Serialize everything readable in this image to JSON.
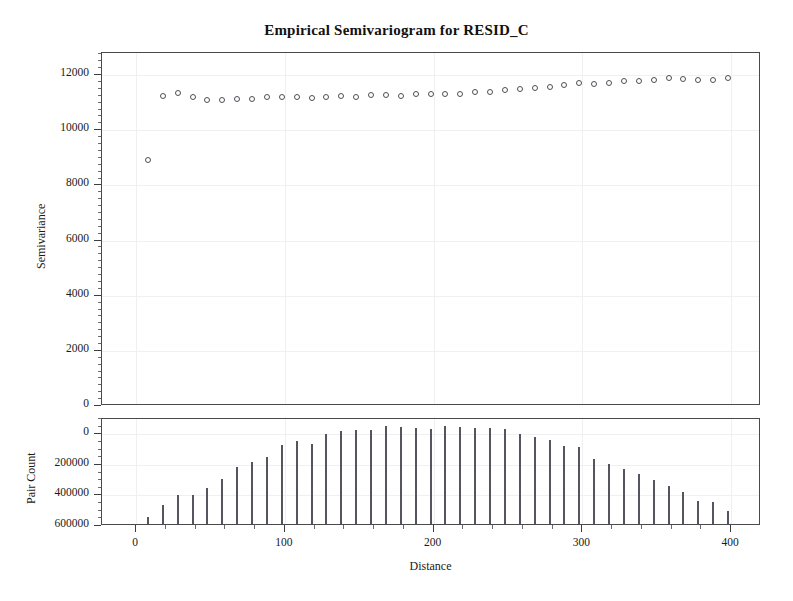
{
  "chart_data": [
    {
      "id": "semivariogram",
      "type": "scatter",
      "title": "Empirical Semivariogram for RESID_C",
      "xlabel": "Distance",
      "ylabel": "Semivariance",
      "xlim": [
        0,
        410
      ],
      "ylim": [
        0,
        12800
      ],
      "xticks": [
        0,
        100,
        200,
        300,
        400
      ],
      "xtick_labels": [
        "0",
        "100",
        "200",
        "300",
        "400"
      ],
      "xminor_step": 20,
      "yticks": [
        0,
        2000,
        4000,
        6000,
        8000,
        10000,
        12000
      ],
      "ytick_labels": [
        "0",
        "2000",
        "4000",
        "6000",
        "8000",
        "10000",
        "12000"
      ],
      "grid": true,
      "legend": "none",
      "marker": "open-circle",
      "x": [
        8,
        18,
        28,
        38,
        48,
        58,
        68,
        78,
        88,
        98,
        108,
        118,
        128,
        138,
        148,
        158,
        168,
        178,
        188,
        198,
        208,
        218,
        228,
        238,
        248,
        258,
        268,
        278,
        288,
        298,
        308,
        318,
        328,
        338,
        348,
        358,
        368,
        378,
        388,
        398
      ],
      "y": [
        8930,
        11230,
        11350,
        11190,
        11080,
        11100,
        11130,
        11140,
        11190,
        11190,
        11190,
        11160,
        11210,
        11240,
        11200,
        11270,
        11280,
        11260,
        11330,
        11300,
        11310,
        11330,
        11380,
        11400,
        11450,
        11490,
        11520,
        11580,
        11640,
        11720,
        11680,
        11730,
        11790,
        11800,
        11830,
        11880,
        11870,
        11820,
        11830,
        11890
      ]
    },
    {
      "id": "pair-count",
      "type": "bar",
      "title": "",
      "xlabel": "Distance",
      "ylabel": "Pair Count",
      "xlim": [
        0,
        410
      ],
      "ylim": [
        0,
        700000
      ],
      "xticks": [
        0,
        100,
        200,
        300,
        400
      ],
      "xtick_labels": [
        "0",
        "100",
        "200",
        "300",
        "400"
      ],
      "xminor_step": 20,
      "yticks": [
        0,
        200000,
        400000,
        600000
      ],
      "ytick_labels": [
        "0",
        "200000",
        "400000",
        "600000"
      ],
      "grid": true,
      "legend": "none",
      "categories": [
        8,
        18,
        28,
        38,
        48,
        58,
        68,
        78,
        88,
        98,
        108,
        118,
        128,
        138,
        148,
        158,
        168,
        178,
        188,
        198,
        208,
        218,
        228,
        238,
        248,
        258,
        268,
        278,
        288,
        298,
        308,
        318,
        328,
        338,
        348,
        358,
        368,
        378,
        388,
        398
      ],
      "values": [
        60000,
        135000,
        205000,
        200000,
        250000,
        310000,
        385000,
        420000,
        450000,
        530000,
        555000,
        535000,
        600000,
        625000,
        630000,
        630000,
        655000,
        645000,
        640000,
        635000,
        655000,
        650000,
        640000,
        640000,
        635000,
        600000,
        580000,
        565000,
        525000,
        520000,
        440000,
        405000,
        375000,
        340000,
        300000,
        260000,
        220000,
        165000,
        155000,
        100000
      ]
    }
  ],
  "figure": {
    "title": "Empirical Semivariogram for RESID_C",
    "top_panel": {
      "ylabel": "Semivariance",
      "ytick_labels": [
        "12000",
        "10000",
        "8000",
        "6000",
        "4000",
        "2000",
        "0"
      ]
    },
    "bottom_panel": {
      "ylabel": "Pair Count",
      "ytick_labels": [
        "600000",
        "400000",
        "200000",
        "0"
      ],
      "xlabel": "Distance",
      "xtick_labels": [
        "0",
        "100",
        "200",
        "300",
        "400"
      ]
    }
  }
}
